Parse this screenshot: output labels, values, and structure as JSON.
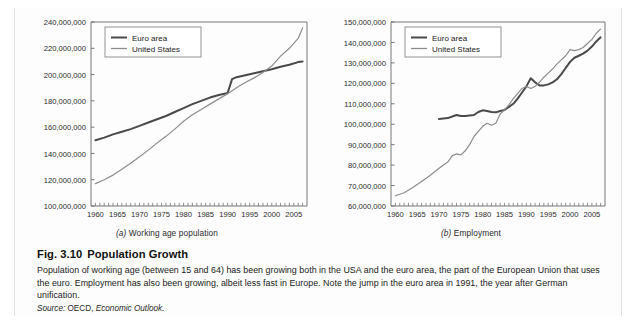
{
  "figure": {
    "number": "Fig. 3.10",
    "title": "Population Growth",
    "body": "Population of working age (between 15 and 64) has been growing both in the USA and the euro area, the part of the European Union that uses the euro. Employment has also been growing, albeit less fast in Europe. Note the jump in the euro area in 1991, the year after German unification.",
    "source_label": "Source:",
    "source_org": "OECD,",
    "source_pub": "Economic Outlook."
  },
  "panels": [
    {
      "index": "(a)",
      "caption": "Working age population"
    },
    {
      "index": "(b)",
      "caption": "Employment"
    }
  ],
  "legend": {
    "euro_label": "Euro area",
    "us_label": "United States",
    "euro_color": "#4a4a4a",
    "us_color": "#8d8d8d"
  },
  "chart_data": [
    {
      "type": "line",
      "title": "Working age population",
      "panel": "(a)",
      "xlabel": "",
      "ylabel": "",
      "xlim": [
        1959,
        2008
      ],
      "ylim": [
        100000000,
        240000000
      ],
      "ytick_labels": [
        "100,000,000",
        "120,000,000",
        "140,000,000",
        "160,000,000",
        "180,000,000",
        "200,000,000",
        "220,000,000",
        "240,000,000"
      ],
      "ytick_values": [
        100000000,
        120000000,
        140000000,
        160000000,
        180000000,
        200000000,
        220000000,
        240000000
      ],
      "xtick_labels": [
        "1960",
        "1965",
        "1970",
        "1975",
        "1980",
        "1985",
        "1990",
        "1995",
        "2000",
        "2005"
      ],
      "xtick_values": [
        1960,
        1965,
        1970,
        1975,
        1980,
        1985,
        1990,
        1995,
        2000,
        2005
      ],
      "minor_xticks": true,
      "grid": false,
      "legend_position": "top-left",
      "series": [
        {
          "name": "Euro area",
          "color": "#4a4a4a",
          "width": 2.0,
          "x": [
            1960,
            1962,
            1964,
            1966,
            1968,
            1970,
            1972,
            1974,
            1976,
            1978,
            1980,
            1982,
            1984,
            1986,
            1988,
            1990,
            1991,
            1992,
            1994,
            1996,
            1998,
            2000,
            2002,
            2004,
            2006,
            2007
          ],
          "values": [
            150000000,
            152000000,
            154500000,
            156500000,
            158500000,
            161000000,
            163500000,
            166000000,
            168500000,
            171500000,
            174500000,
            177500000,
            180000000,
            182500000,
            184500000,
            186000000,
            196500000,
            198000000,
            199500000,
            201000000,
            202500000,
            204000000,
            206000000,
            207500000,
            209500000,
            210000000
          ]
        },
        {
          "name": "United States",
          "color": "#8d8d8d",
          "width": 1.2,
          "x": [
            1960,
            1962,
            1964,
            1966,
            1968,
            1970,
            1972,
            1974,
            1976,
            1978,
            1980,
            1982,
            1984,
            1986,
            1988,
            1990,
            1992,
            1994,
            1996,
            1998,
            2000,
            2002,
            2004,
            2006,
            2007
          ],
          "values": [
            117000000,
            120000000,
            123500000,
            128000000,
            132500000,
            137500000,
            142500000,
            148000000,
            153000000,
            158500000,
            164500000,
            169500000,
            173500000,
            177500000,
            181500000,
            185500000,
            190000000,
            194000000,
            197500000,
            201500000,
            206500000,
            214000000,
            220000000,
            227500000,
            235500000
          ]
        }
      ]
    },
    {
      "type": "line",
      "title": "Employment",
      "panel": "(b)",
      "xlabel": "",
      "ylabel": "",
      "xlim": [
        1959,
        2008
      ],
      "ylim": [
        60000000,
        150000000
      ],
      "ytick_labels": [
        "60,000,000",
        "70,000,000",
        "80,000,000",
        "90,000,000",
        "100,000,000",
        "110,000,000",
        "120,000,000",
        "130,000,000",
        "140,000,000",
        "150,000,000"
      ],
      "ytick_values": [
        60000000,
        70000000,
        80000000,
        90000000,
        100000000,
        110000000,
        120000000,
        130000000,
        140000000,
        150000000
      ],
      "xtick_labels": [
        "1960",
        "1965",
        "1970",
        "1975",
        "1980",
        "1985",
        "1990",
        "1995",
        "2000",
        "2005"
      ],
      "xtick_values": [
        1960,
        1965,
        1970,
        1975,
        1980,
        1985,
        1990,
        1995,
        2000,
        2005
      ],
      "minor_xticks": true,
      "grid": false,
      "legend_position": "top-left",
      "series": [
        {
          "name": "Euro area",
          "color": "#4a4a4a",
          "width": 2.0,
          "x": [
            1970,
            1972,
            1974,
            1975,
            1976,
            1978,
            1979,
            1980,
            1981,
            1982,
            1983,
            1984,
            1985,
            1986,
            1987,
            1988,
            1989,
            1990,
            1991,
            1992,
            1993,
            1994,
            1995,
            1996,
            1997,
            1998,
            1999,
            2000,
            2001,
            2002,
            2003,
            2004,
            2005,
            2006,
            2007
          ],
          "values": [
            102500000,
            103000000,
            104500000,
            104000000,
            104000000,
            104500000,
            106000000,
            106800000,
            106500000,
            106000000,
            105800000,
            106500000,
            107000000,
            108500000,
            110000000,
            112500000,
            115500000,
            118500000,
            122500000,
            120500000,
            119000000,
            119000000,
            119500000,
            120500000,
            122000000,
            124500000,
            127500000,
            130500000,
            132500000,
            133500000,
            134500000,
            136000000,
            138000000,
            140500000,
            142500000
          ]
        },
        {
          "name": "United States",
          "color": "#8d8d8d",
          "width": 1.2,
          "x": [
            1960,
            1962,
            1964,
            1966,
            1968,
            1970,
            1972,
            1973,
            1974,
            1975,
            1976,
            1977,
            1978,
            1979,
            1980,
            1981,
            1982,
            1983,
            1984,
            1985,
            1986,
            1987,
            1988,
            1989,
            1990,
            1991,
            1992,
            1993,
            1994,
            1995,
            1996,
            1997,
            1998,
            1999,
            2000,
            2001,
            2002,
            2003,
            2004,
            2005,
            2006,
            2007
          ],
          "values": [
            65000000,
            66500000,
            69000000,
            72000000,
            75000000,
            78500000,
            81500000,
            84500000,
            85500000,
            85000000,
            87000000,
            90000000,
            94000000,
            96500000,
            99000000,
            100500000,
            99500000,
            100500000,
            105000000,
            107000000,
            109500000,
            112500000,
            115000000,
            117500000,
            118500000,
            117500000,
            118500000,
            120500000,
            123000000,
            125000000,
            127000000,
            129500000,
            131500000,
            133500000,
            136500000,
            136000000,
            136500000,
            137500000,
            139500000,
            141500000,
            144500000,
            146500000
          ]
        }
      ]
    }
  ]
}
